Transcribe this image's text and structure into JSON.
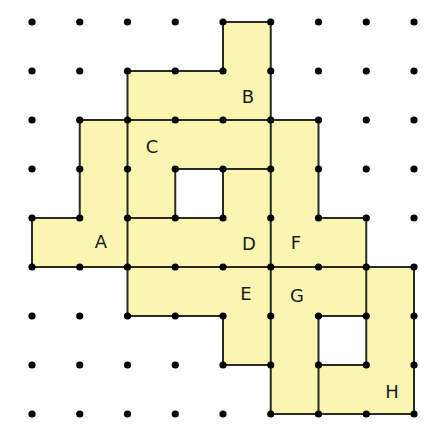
{
  "diagram": {
    "grid": {
      "cols": 9,
      "rows": 9,
      "origin_x": 32,
      "origin_y": 22,
      "step_x": 47.75,
      "step_y": 49
    },
    "colors": {
      "fill": "#faf6b2",
      "line": "#2a2a22",
      "dot": "#000000",
      "label": "#1a1a1a"
    },
    "regions": [
      {
        "label": "A",
        "cells": [
          [
            1,
            2
          ],
          [
            1,
            3
          ],
          [
            0,
            4
          ],
          [
            1,
            4
          ]
        ],
        "label_pos": [
          101,
          241
        ]
      },
      {
        "label": "B",
        "cells": [
          [
            4,
            0
          ],
          [
            2,
            1
          ],
          [
            3,
            1
          ],
          [
            4,
            1
          ]
        ],
        "label_pos": [
          248,
          96
        ]
      },
      {
        "label": "C",
        "cells": [
          [
            2,
            2
          ],
          [
            3,
            2
          ],
          [
            4,
            2
          ],
          [
            2,
            3
          ]
        ],
        "label_pos": [
          152,
          146
        ]
      },
      {
        "label": "D",
        "cells": [
          [
            4,
            3
          ],
          [
            2,
            4
          ],
          [
            3,
            4
          ],
          [
            4,
            4
          ]
        ],
        "label_pos": [
          249,
          243
        ]
      },
      {
        "label": "E",
        "cells": [
          [
            2,
            5
          ],
          [
            3,
            5
          ],
          [
            4,
            5
          ],
          [
            4,
            6
          ]
        ],
        "label_pos": [
          246,
          293
        ]
      },
      {
        "label": "F",
        "cells": [
          [
            5,
            2
          ],
          [
            5,
            3
          ],
          [
            5,
            4
          ],
          [
            6,
            4
          ]
        ],
        "label_pos": [
          296,
          242
        ]
      },
      {
        "label": "G",
        "cells": [
          [
            5,
            5
          ],
          [
            6,
            5
          ],
          [
            5,
            6
          ],
          [
            5,
            7
          ]
        ],
        "label_pos": [
          297,
          295
        ]
      },
      {
        "label": "H",
        "cells": [
          [
            7,
            5
          ],
          [
            7,
            6
          ],
          [
            7,
            7
          ],
          [
            6,
            7
          ]
        ],
        "label_pos": [
          392,
          391
        ]
      }
    ],
    "holes": [
      [
        3,
        3
      ],
      [
        6,
        6
      ]
    ]
  }
}
